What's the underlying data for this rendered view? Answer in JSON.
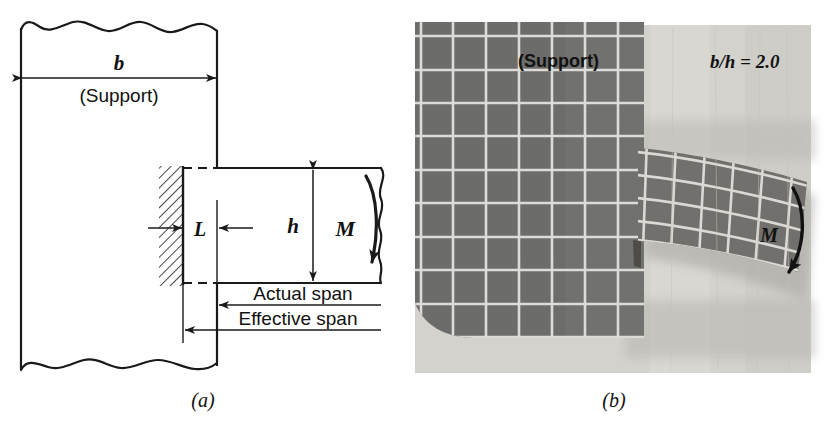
{
  "figure": {
    "panel_a": {
      "caption": "(a)",
      "labels": {
        "b": "b",
        "support": "(Support)",
        "L": "L",
        "h": "h",
        "M": "M",
        "actual_span": "Actual span",
        "effective_span": "Effective span"
      },
      "icons": {
        "b_dimension_arrow": "double-arrow-icon",
        "h_dimension_arrow": "double-arrow-icon",
        "moment_arrow": "curved-arrow-icon",
        "fixed_support_hatching": "hatching-icon"
      },
      "colors": {
        "line": "#1a1a1a",
        "background": "#ffffff"
      }
    },
    "panel_b": {
      "caption": "(b)",
      "labels": {
        "support": "(Support)",
        "ratio": "b/h = 2.0",
        "M": "M"
      },
      "icons": {
        "moment_arrow": "curved-arrow-icon"
      },
      "colors": {
        "photo_background": "#d9d7d2",
        "specimen_dark": "#71706e",
        "grid_line": "#e8e7e3",
        "shadow": "#b3b1ac"
      },
      "grid": {
        "support_columns": 7,
        "support_rows": 9,
        "beam_columns": 6,
        "beam_rows": 4
      }
    }
  }
}
